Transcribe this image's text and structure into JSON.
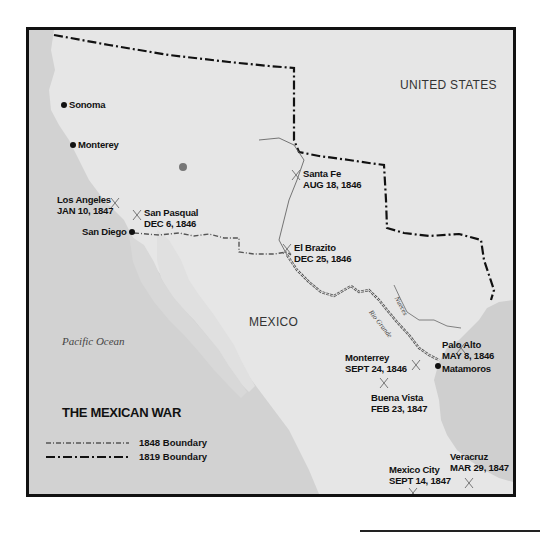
{
  "map": {
    "title": "THE MEXICAN WAR",
    "colors": {
      "land": "#e8e8e8",
      "sea": "#cfcfcf",
      "frame": "#111111",
      "boundary": "#111111",
      "boundary_1848": "#555555",
      "river": "#666666",
      "battle_marker": "#777777"
    },
    "regions": {
      "united_states": "UNITED STATES",
      "mexico": "MEXICO",
      "pacific_ocean": "Pacific Ocean"
    },
    "rivers": {
      "rio_grande": "Rio Grande",
      "nueces": "Nueces"
    },
    "towns": [
      {
        "name": "Sonoma"
      },
      {
        "name": "Monterey"
      },
      {
        "name": "San Diego"
      },
      {
        "name": "Matamoros"
      }
    ],
    "battles": [
      {
        "name": "Los Angeles",
        "date": "JAN 10, 1847"
      },
      {
        "name": "San Pasqual",
        "date": "DEC 6, 1846"
      },
      {
        "name": "Santa Fe",
        "date": "AUG 18, 1846"
      },
      {
        "name": "El Brazito",
        "date": "DEC 25, 1846"
      },
      {
        "name": "Palo Alto",
        "date": "MAY 8, 1846"
      },
      {
        "name": "Monterrey",
        "date": "SEPT 24, 1846"
      },
      {
        "name": "Buena Vista",
        "date": "FEB 23, 1847"
      },
      {
        "name": "Veracruz",
        "date": "MAR 29, 1847"
      },
      {
        "name": "Mexico City",
        "date": "SEPT 14, 1847"
      }
    ],
    "legend": [
      {
        "label": "1848 Boundary",
        "style": "dash-dot-fine"
      },
      {
        "label": "1819 Boundary",
        "style": "dash-dot-bold"
      }
    ]
  }
}
